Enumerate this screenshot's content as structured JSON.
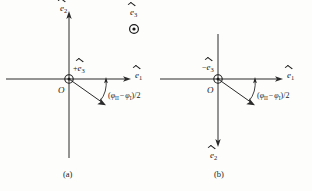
{
  "figure": {
    "background_color": "#fdfdfc",
    "line_color": "#1a1a1a",
    "panel_count": 2
  },
  "panels": [
    {
      "id": "a",
      "caption": "(a)",
      "origin_label": "O",
      "axis_horizontal": {
        "symbol": "e",
        "subscript": "1",
        "accent": "hat",
        "direction": "right",
        "label": "ê₁"
      },
      "axis_vertical": {
        "symbol": "e",
        "subscript": "2",
        "accent": "hat",
        "direction": "up",
        "label": "ê₂"
      },
      "out_of_page_marker": {
        "sign": "+",
        "symbol": "e",
        "subscript": "3",
        "accent": "hat",
        "label": "+ê₃",
        "glyph": "circle-dot",
        "meaning": "vector out of page at origin"
      },
      "standalone_marker": {
        "symbol": "e",
        "subscript": "3",
        "accent": "hat",
        "label": "ê₃",
        "glyph": "circle-dot",
        "meaning": "vector out of page"
      },
      "angle_label": {
        "text_prefix": "(",
        "phi": "φ",
        "sub_second": "II",
        "minus": "−",
        "sub_first": "I",
        "suffix": ")/2",
        "full": "(φ_II − φ_I)/2"
      },
      "rotated_vector": {
        "direction": "down-right",
        "angle_deg_from_e1": -35
      }
    },
    {
      "id": "b",
      "caption": "(b)",
      "origin_label": "O",
      "axis_horizontal": {
        "symbol": "e",
        "subscript": "1",
        "accent": "hat",
        "direction": "right",
        "label": "ê₁"
      },
      "axis_vertical": {
        "symbol": "e",
        "subscript": "2",
        "accent": "hat",
        "direction": "down",
        "label": "ê₂"
      },
      "out_of_page_marker": {
        "sign": "−",
        "symbol": "e",
        "subscript": "3",
        "accent": "hat",
        "label": "−ê₃",
        "glyph": "circle-dot",
        "meaning": "vector out of page at origin, negative sense"
      },
      "standalone_marker": null,
      "angle_label": {
        "text_prefix": "(",
        "phi": "φ",
        "sub_second": "II",
        "minus": "−",
        "sub_first": "I",
        "suffix": ")/2",
        "full": "(φ_II − φ_I)/2"
      },
      "rotated_vector": {
        "direction": "down-right",
        "angle_deg_from_e1": -35
      }
    }
  ]
}
